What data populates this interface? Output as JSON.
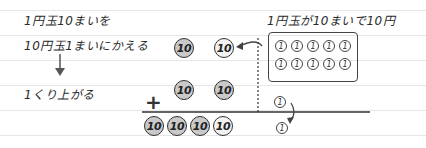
{
  "notes": {
    "line1": "1円玉10まいを",
    "line2": "10円玉1まいにかえる",
    "carry": "1くり上がる",
    "box_caption": "1円玉が10まいで10円"
  },
  "operator": "+",
  "coins": {
    "ten_label": "10",
    "one_label": "1",
    "row1": [
      {
        "value": "10",
        "style": "grey"
      },
      {
        "value": "10",
        "style": "light"
      }
    ],
    "row2": [
      {
        "value": "10",
        "style": "grey"
      },
      {
        "value": "10",
        "style": "grey"
      }
    ],
    "result_tens": [
      {
        "value": "10",
        "style": "grey"
      },
      {
        "value": "10",
        "style": "grey"
      },
      {
        "value": "10",
        "style": "grey"
      },
      {
        "value": "10",
        "style": "light"
      }
    ],
    "ones_box_count": 10,
    "ones_box_rows": 2,
    "ones_box_cols": 5,
    "ones_extra": "1",
    "ones_result": "1"
  },
  "colors": {
    "ink": "#2a2a2a",
    "coin_grey": "#c9c9c9",
    "coin_light": "#f2f2f2",
    "ruled_line": "#e6e6e6"
  }
}
